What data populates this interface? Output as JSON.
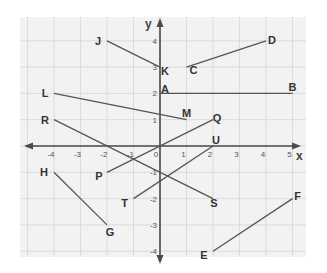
{
  "chart_data": {
    "type": "scatter",
    "title": "",
    "xlabel": "x",
    "ylabel": "y",
    "xlim": [
      -4.5,
      5.2
    ],
    "ylim": [
      -4.3,
      4.6
    ],
    "grid": true,
    "x_ticks": [
      "-4",
      "-3",
      "-2",
      "-1",
      "0",
      "1",
      "2",
      "3",
      "4",
      "5"
    ],
    "y_ticks": [
      "4",
      "3",
      "2",
      "1",
      "-1",
      "-2",
      "-3",
      "-4"
    ],
    "segments": [
      {
        "from": {
          "label": "J",
          "x": -2,
          "y": 4
        },
        "to": {
          "label": "K",
          "x": 0,
          "y": 3
        }
      },
      {
        "from": {
          "label": "C",
          "x": 1,
          "y": 3
        },
        "to": {
          "label": "D",
          "x": 4,
          "y": 4
        }
      },
      {
        "from": {
          "label": "A",
          "x": 0,
          "y": 2
        },
        "to": {
          "label": "B",
          "x": 5,
          "y": 2
        }
      },
      {
        "from": {
          "label": "L",
          "x": -4,
          "y": 2
        },
        "to": {
          "label": "M",
          "x": 1,
          "y": 1
        }
      },
      {
        "from": {
          "label": "R",
          "x": -4,
          "y": 1
        },
        "to": {
          "label": "S",
          "x": 2,
          "y": -2
        }
      },
      {
        "from": {
          "label": "P",
          "x": -2,
          "y": -1
        },
        "to": {
          "label": "Q",
          "x": 2,
          "y": 1
        }
      },
      {
        "from": {
          "label": "T",
          "x": -1,
          "y": -2
        },
        "to": {
          "label": "U",
          "x": 2,
          "y": 0
        }
      },
      {
        "from": {
          "label": "H",
          "x": -4,
          "y": -1
        },
        "to": {
          "label": "G",
          "x": -2,
          "y": -3
        }
      },
      {
        "from": {
          "label": "E",
          "x": 2,
          "y": -4
        },
        "to": {
          "label": "F",
          "x": 5,
          "y": -2
        }
      }
    ]
  },
  "colors": {
    "background": "#f2f2f2",
    "grid": "#d6d6d6",
    "axis": "#4a4a4a",
    "segment": "#555555",
    "label": "#333333"
  }
}
